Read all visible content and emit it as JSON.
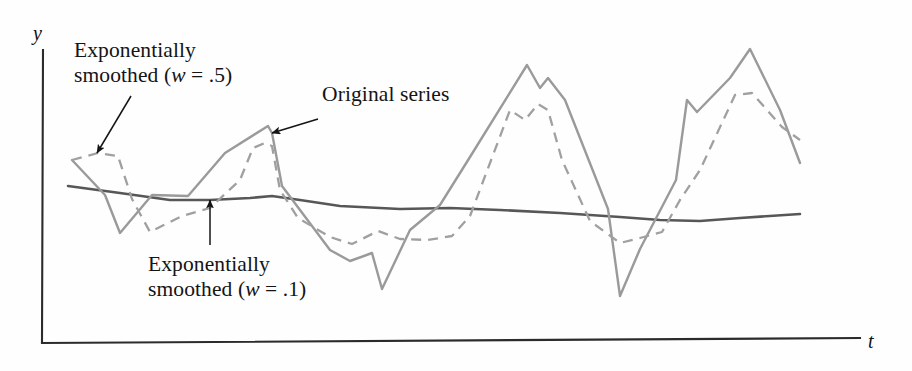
{
  "figure": {
    "name": "exponential-smoothing-time-series-figure",
    "background_color": "#fefefe"
  },
  "axes": {
    "y_label": "y",
    "x_label": "t",
    "axis_color": "#2b2b2b",
    "x_axis": {
      "x_start": 42,
      "x_end": 860,
      "y": 342
    },
    "y_axis": {
      "x": 42,
      "y_start": 50,
      "y_end": 342
    }
  },
  "annotations": [
    {
      "id": "smoothed-w05",
      "line1": "Exponentially",
      "line2_prefix": "smoothed (",
      "line2_var": "w",
      "line2_suffix": " = .5)",
      "arrow_from": {
        "x": 131,
        "y": 96
      },
      "arrow_to": {
        "x": 97,
        "y": 153
      }
    },
    {
      "id": "original-series",
      "line1": "Original series",
      "line2_prefix": "",
      "line2_var": "",
      "line2_suffix": "",
      "arrow_from": {
        "x": 318,
        "y": 119
      },
      "arrow_to": {
        "x": 272,
        "y": 133
      }
    },
    {
      "id": "smoothed-w01",
      "line1": "Exponentially",
      "line2_prefix": "smoothed (",
      "line2_var": "w",
      "line2_suffix": " = .1)",
      "arrow_from": {
        "x": 210,
        "y": 245
      },
      "arrow_to": {
        "x": 210,
        "y": 200
      }
    }
  ],
  "chart_data": {
    "type": "line",
    "title": "",
    "subtitle": "",
    "xlabel": "t",
    "ylabel": "y",
    "grid": false,
    "legend": "annotations-with-arrows",
    "xlim": [
      42,
      860
    ],
    "ylim": [
      342,
      50
    ],
    "note": "Pixel-space polyline vertices read off the scanned figure; y increases downward in pixel coords.",
    "series": [
      {
        "name": "Original series",
        "style": "solid",
        "color": "#9a9a9a",
        "width": 2.4,
        "points": [
          [
            72,
            160
          ],
          [
            105,
            195
          ],
          [
            120,
            233
          ],
          [
            152,
            195
          ],
          [
            188,
            196
          ],
          [
            225,
            153
          ],
          [
            268,
            126
          ],
          [
            272,
            133
          ],
          [
            282,
            186
          ],
          [
            330,
            250
          ],
          [
            350,
            261
          ],
          [
            372,
            253
          ],
          [
            382,
            289
          ],
          [
            410,
            230
          ],
          [
            440,
            205
          ],
          [
            470,
            157
          ],
          [
            527,
            65
          ],
          [
            540,
            88
          ],
          [
            548,
            78
          ],
          [
            565,
            100
          ],
          [
            608,
            209
          ],
          [
            620,
            296
          ],
          [
            640,
            249
          ],
          [
            676,
            180
          ],
          [
            687,
            100
          ],
          [
            697,
            112
          ],
          [
            730,
            78
          ],
          [
            750,
            49
          ],
          [
            780,
            110
          ],
          [
            800,
            163
          ]
        ]
      },
      {
        "name": "Exponentially smoothed (w = .5)",
        "style": "dashed",
        "color": "#a0a0a0",
        "width": 2.3,
        "dash": "10 7",
        "points": [
          [
            72,
            160
          ],
          [
            98,
            153
          ],
          [
            118,
            156
          ],
          [
            132,
            199
          ],
          [
            150,
            232
          ],
          [
            182,
            216
          ],
          [
            210,
            208
          ],
          [
            240,
            180
          ],
          [
            253,
            148
          ],
          [
            265,
            143
          ],
          [
            272,
            146
          ],
          [
            280,
            190
          ],
          [
            298,
            218
          ],
          [
            330,
            237
          ],
          [
            352,
            244
          ],
          [
            378,
            231
          ],
          [
            400,
            239
          ],
          [
            428,
            240
          ],
          [
            452,
            236
          ],
          [
            470,
            216
          ],
          [
            510,
            110
          ],
          [
            525,
            120
          ],
          [
            538,
            104
          ],
          [
            548,
            110
          ],
          [
            562,
            160
          ],
          [
            590,
            221
          ],
          [
            620,
            243
          ],
          [
            640,
            238
          ],
          [
            662,
            232
          ],
          [
            680,
            200
          ],
          [
            700,
            170
          ],
          [
            735,
            95
          ],
          [
            752,
            93
          ],
          [
            782,
            127
          ],
          [
            800,
            140
          ]
        ]
      },
      {
        "name": "Exponentially smoothed (w = .1)",
        "style": "solid",
        "color": "#575757",
        "width": 2.6,
        "points": [
          [
            68,
            186
          ],
          [
            120,
            193
          ],
          [
            170,
            200
          ],
          [
            210,
            200
          ],
          [
            250,
            198
          ],
          [
            272,
            196
          ],
          [
            300,
            200
          ],
          [
            340,
            206
          ],
          [
            400,
            209
          ],
          [
            450,
            208
          ],
          [
            500,
            210
          ],
          [
            560,
            213
          ],
          [
            620,
            217
          ],
          [
            660,
            220
          ],
          [
            700,
            221
          ],
          [
            740,
            218
          ],
          [
            800,
            214
          ]
        ]
      }
    ]
  }
}
